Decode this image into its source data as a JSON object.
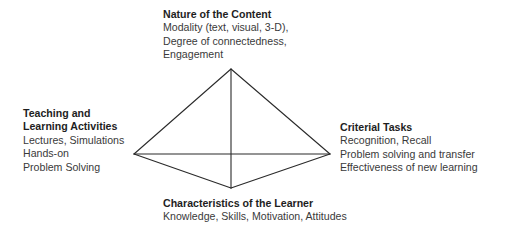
{
  "diagram": {
    "type": "pyramid-tetrahedron",
    "stroke_color": "#2a2a2a",
    "vertices": {
      "top": [
        231,
        69
      ],
      "left": [
        134,
        154
      ],
      "right": [
        330,
        154
      ],
      "bottom": [
        231,
        188
      ]
    },
    "nodes": {
      "top": {
        "title": "Nature of the Content",
        "lines": [
          "Modality (text, visual, 3-D),",
          "Degree of connectedness,",
          "Engagement"
        ]
      },
      "left": {
        "title_lines": [
          "Teaching and",
          "Learning Activities"
        ],
        "lines": [
          "Lectures, Simulations",
          "Hands-on",
          "Problem Solving"
        ]
      },
      "right": {
        "title": "Criterial Tasks",
        "lines": [
          "Recognition, Recall",
          "Problem solving and transfer",
          "Effectiveness of new learning"
        ]
      },
      "bottom": {
        "title": "Characteristics of the Learner",
        "lines": [
          "Knowledge, Skills, Motivation, Attitudes"
        ]
      }
    }
  }
}
